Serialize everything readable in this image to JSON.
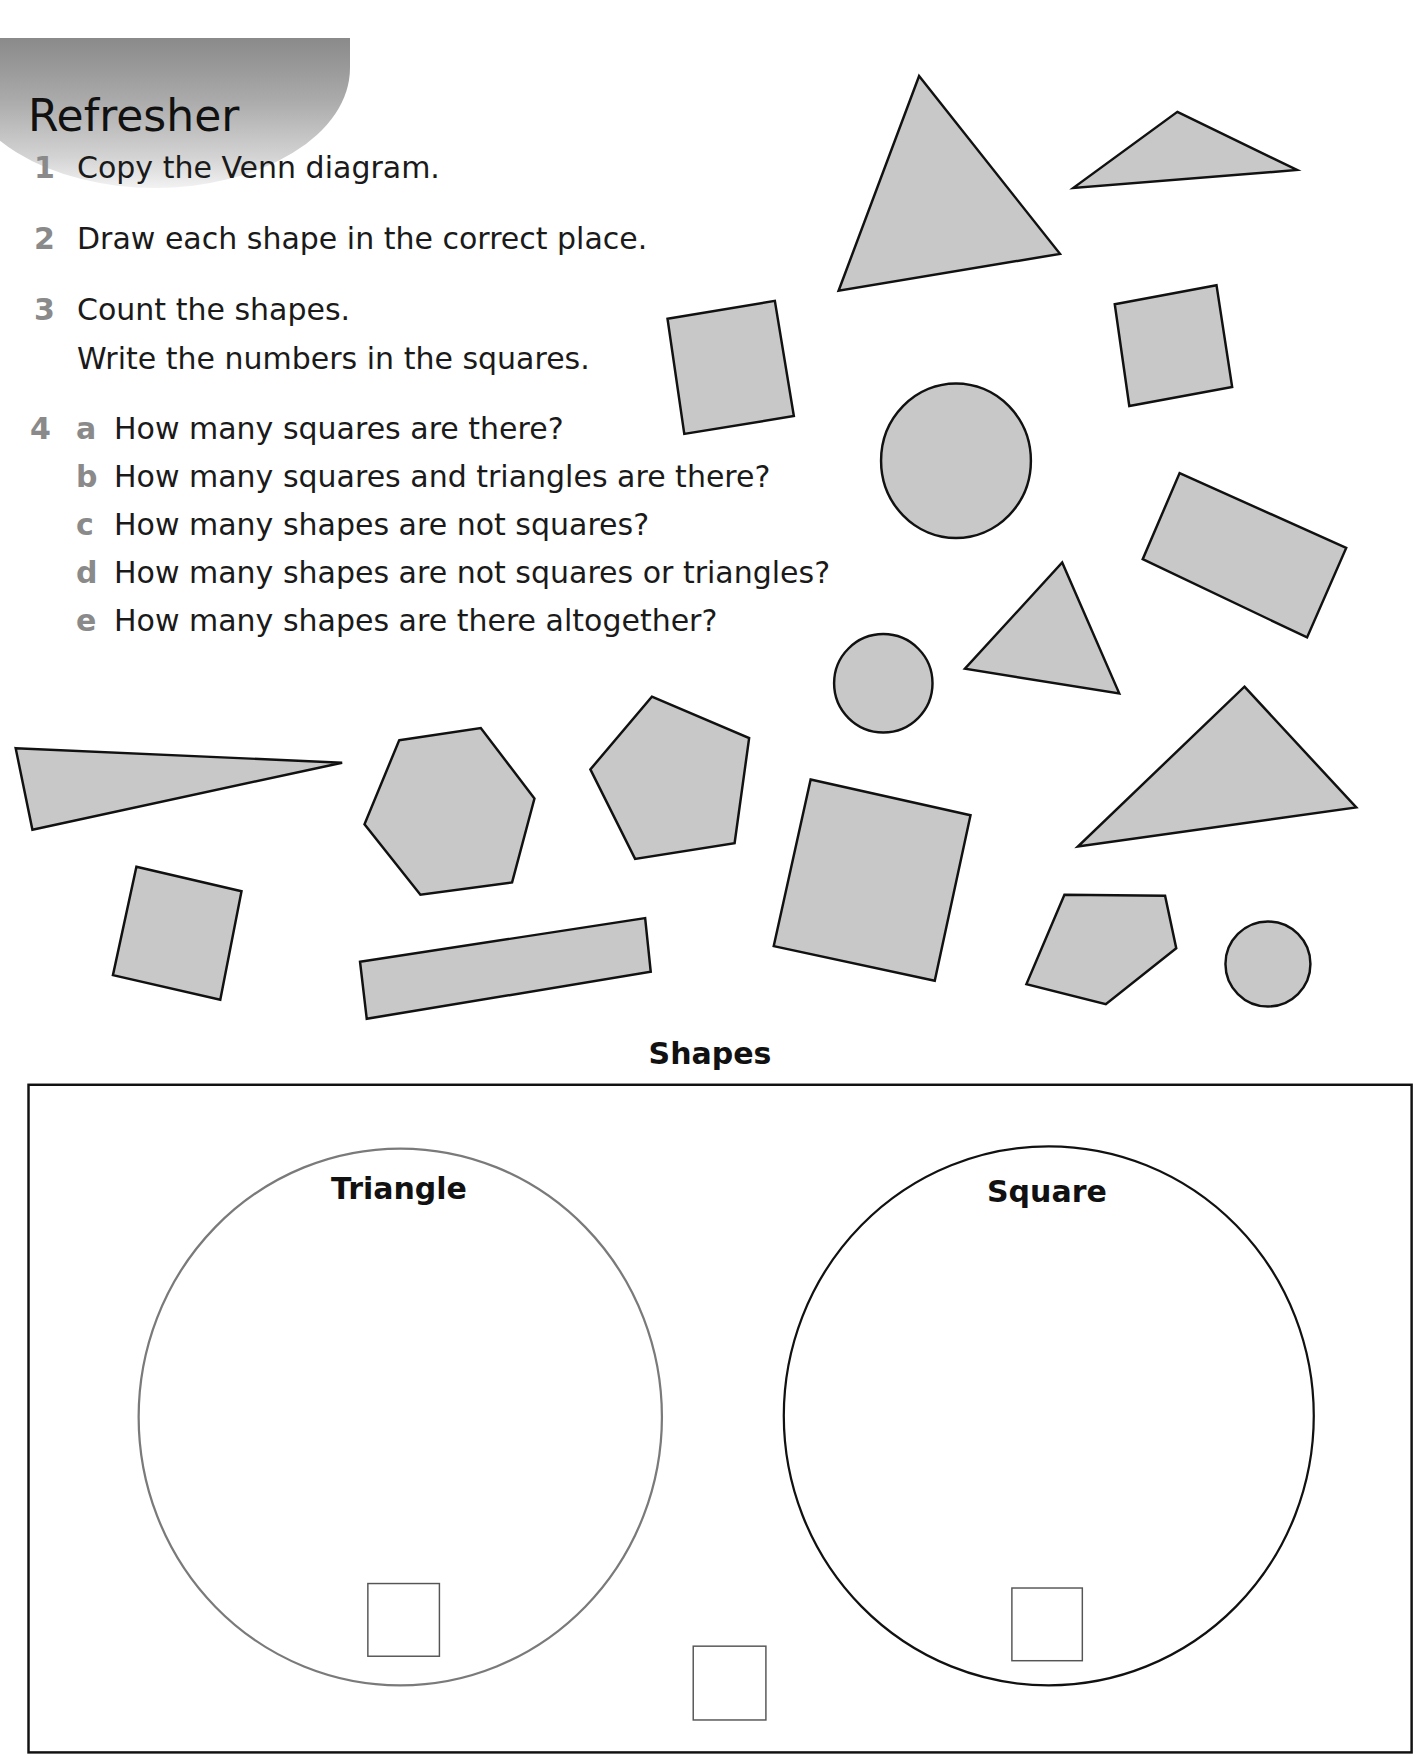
{
  "header": {
    "tab_label": "Refresher"
  },
  "instructions": [
    {
      "number": "1",
      "lines": [
        "Copy the Venn diagram."
      ]
    },
    {
      "number": "2",
      "lines": [
        "Draw each shape in the correct place."
      ]
    },
    {
      "number": "3",
      "lines": [
        "Count the shapes.",
        "Write the numbers in the squares."
      ]
    }
  ],
  "question4": {
    "number": "4",
    "parts": [
      {
        "letter": "a",
        "text": "How many squares are there?"
      },
      {
        "letter": "b",
        "text": "How many squares and triangles are there?"
      },
      {
        "letter": "c",
        "text": "How many shapes are not squares?"
      },
      {
        "letter": "d",
        "text": "How many shapes are not squares or triangles?"
      },
      {
        "letter": "e",
        "text": "How many shapes are there altogether?"
      }
    ]
  },
  "shapes_panel": {
    "fill_color": "#c8c8c8",
    "stroke_color": "#111111",
    "shapes": [
      {
        "type": "triangle",
        "label": "large triangle"
      },
      {
        "type": "triangle",
        "label": "small obtuse triangle"
      },
      {
        "type": "square",
        "label": "tilted square top-left"
      },
      {
        "type": "square",
        "label": "tilted square top-right"
      },
      {
        "type": "circle",
        "label": "large circle"
      },
      {
        "type": "rectangle",
        "label": "tilted rectangle"
      },
      {
        "type": "triangle",
        "label": "medium triangle"
      },
      {
        "type": "circle",
        "label": "small circle"
      },
      {
        "type": "triangle",
        "label": "long thin triangle"
      },
      {
        "type": "hexagon",
        "label": "hexagon"
      },
      {
        "type": "pentagon",
        "label": "regular pentagon"
      },
      {
        "type": "square",
        "label": "large tilted square"
      },
      {
        "type": "triangle",
        "label": "wide triangle"
      },
      {
        "type": "square",
        "label": "small tilted square bottom-left"
      },
      {
        "type": "rectangle",
        "label": "long thin rectangle"
      },
      {
        "type": "pentagon",
        "label": "irregular pentagon"
      },
      {
        "type": "circle",
        "label": "small circle bottom-right"
      }
    ]
  },
  "venn": {
    "title": "Shapes",
    "sets": [
      {
        "label": "Triangle",
        "outline_color": "#7a7a7a",
        "count": ""
      },
      {
        "label": "Square",
        "outline_color": "#111111",
        "count": ""
      }
    ],
    "outside_count": ""
  }
}
